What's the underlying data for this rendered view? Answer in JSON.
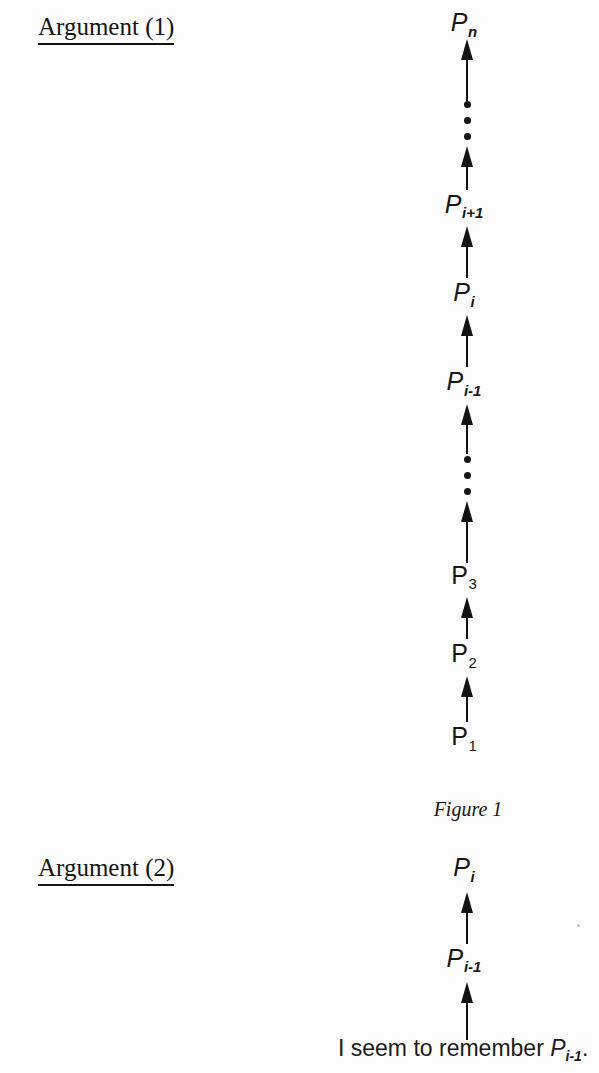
{
  "page": {
    "background_color": "#fdfdfd",
    "ink_color": "#131313"
  },
  "argument1": {
    "heading": "Argument (1)",
    "caption": "Figure 1",
    "chain_description": "Vertical chain of upward arrows from P1 at the bottom to Pn at the top, with two vertical ellipses standing in for omitted steps.",
    "nodes": [
      {
        "id": "p-n",
        "base": "P",
        "sub": "n",
        "style": "italic",
        "label": "Pn"
      },
      {
        "id": "p-i-plus-1",
        "base": "P",
        "sub": "i+1",
        "style": "italic",
        "label": "Pi+1"
      },
      {
        "id": "p-i",
        "base": "P",
        "sub": "i",
        "style": "italic",
        "label": "Pi"
      },
      {
        "id": "p-i-minus-1",
        "base": "P",
        "sub": "i-1",
        "style": "italic",
        "label": "Pi-1"
      },
      {
        "id": "p-3",
        "base": "P",
        "sub": "3",
        "style": "upright",
        "label": "P3"
      },
      {
        "id": "p-2",
        "base": "P",
        "sub": "2",
        "style": "upright",
        "label": "P2"
      },
      {
        "id": "p-1",
        "base": "P",
        "sub": "1",
        "style": "upright",
        "label": "P1"
      }
    ],
    "ellipsis_dots": 3
  },
  "argument2": {
    "heading": "Argument (2)",
    "nodes": [
      {
        "id": "a2-p-i",
        "base": "P",
        "sub": "i",
        "style": "italic",
        "label": "Pi"
      },
      {
        "id": "a2-p-i-minus-1",
        "base": "P",
        "sub": "i-1",
        "style": "italic",
        "label": "Pi-1"
      }
    ],
    "premise": {
      "text_before": "I seem to remember ",
      "symbol": "P",
      "symbol_sub": "i-1",
      "text_after": ".",
      "full": "I seem to remember Pi-1."
    }
  }
}
